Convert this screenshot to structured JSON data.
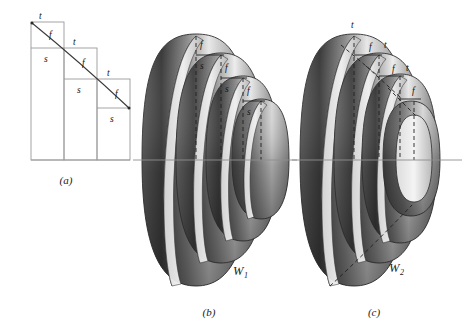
{
  "figure": {
    "background": "#ffffff",
    "panels": [
      {
        "id": "a",
        "label": "(a)",
        "kind": "staircase-diagram",
        "description": "Descending staircase of three rectangular columns crossed by a diagonal line",
        "steps": [
          {
            "index": 1,
            "top_label": "t",
            "diagonal_label": "f",
            "horizontal_label": "s"
          },
          {
            "index": 2,
            "top_label": "t",
            "diagonal_label": "f",
            "horizontal_label": "s"
          },
          {
            "index": 3,
            "top_label": "t",
            "diagonal_label": "f",
            "horizontal_label": "s"
          }
        ]
      },
      {
        "id": "b",
        "label": "(b)",
        "kind": "nested-tori",
        "surface_label": "W",
        "surface_subscript": "1",
        "ring_count": 4,
        "annotations": [
          "f",
          "s",
          "f",
          "s",
          "f",
          "s"
        ],
        "has_dashed_vertical_lines": true,
        "has_horizontal_axis": true
      },
      {
        "id": "c",
        "label": "(c)",
        "kind": "nested-tori",
        "surface_label": "W",
        "surface_subscript": "2",
        "ring_count": 4,
        "annotations": [
          "t",
          "f",
          "t",
          "f",
          "t",
          "f"
        ],
        "has_dashed_diagonal_arrows": true,
        "has_horizontal_axis": true
      }
    ],
    "colors": {
      "ink": "#141414",
      "rule": "#9a9a9a",
      "axis": "#8e8e8e",
      "outline": "#2e2e2e",
      "shade_dark": "#3d3d3d",
      "shade_mid": "#9b9b9b",
      "shade_light": "#efefef"
    }
  }
}
